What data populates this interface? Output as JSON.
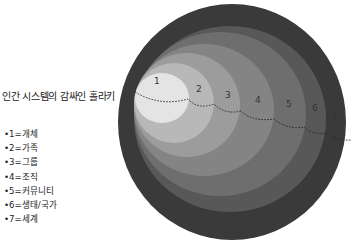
{
  "title": "인간 시스템의 감싸인 홀라키",
  "legend": [
    {
      "text": "•1=개체"
    },
    {
      "text": "•2=가족"
    },
    {
      "text": "•3=그룹"
    },
    {
      "text": "•4=조직"
    },
    {
      "text": "•5=커뮤니티"
    },
    {
      "text": "•6=생태/국가"
    },
    {
      "text": "•7=세계"
    }
  ],
  "rings": [
    {
      "label": "7",
      "color": "#3a3a3a"
    },
    {
      "label": "6",
      "color": "#585858"
    },
    {
      "label": "5",
      "color": "#6e6e6e"
    },
    {
      "label": "4",
      "color": "#848484"
    },
    {
      "label": "3",
      "color": "#9c9c9c"
    },
    {
      "label": "2",
      "color": "#b8b8b8"
    },
    {
      "label": "1",
      "color": "#e4e4e4"
    }
  ]
}
